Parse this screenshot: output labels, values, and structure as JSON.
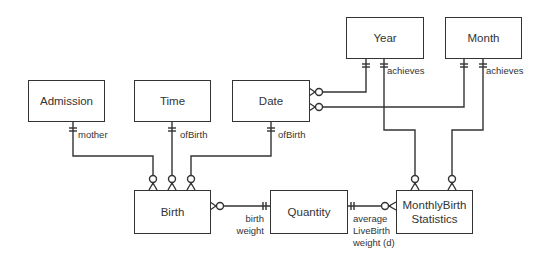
{
  "diagram": {
    "type": "entity-relationship",
    "entities": [
      {
        "id": "admission",
        "label": "Admission"
      },
      {
        "id": "time",
        "label": "Time"
      },
      {
        "id": "date",
        "label": "Date"
      },
      {
        "id": "year",
        "label": "Year"
      },
      {
        "id": "month",
        "label": "Month"
      },
      {
        "id": "birth",
        "label": "Birth"
      },
      {
        "id": "quantity",
        "label": "Quantity"
      },
      {
        "id": "monthly",
        "label": "MonthlyBirth Statistics",
        "line1": "MonthlyBirth",
        "line2": "Statistics"
      }
    ],
    "relationships": [
      {
        "from": "admission",
        "to": "birth",
        "label": "mother",
        "from_card": "one-and-only-one",
        "to_card": "zero-or-many"
      },
      {
        "from": "time",
        "to": "birth",
        "label": "ofBirth",
        "from_card": "one-and-only-one",
        "to_card": "zero-or-many"
      },
      {
        "from": "date",
        "to": "birth",
        "label": "ofBirth",
        "from_card": "one-and-only-one",
        "to_card": "zero-or-many"
      },
      {
        "from": "year",
        "to": "date",
        "label": "",
        "from_card": "one-and-only-one",
        "to_card": "zero-or-many"
      },
      {
        "from": "month",
        "to": "date",
        "label": "",
        "from_card": "one-and-only-one",
        "to_card": "zero-or-many"
      },
      {
        "from": "year",
        "to": "monthly",
        "label": "achieves",
        "from_card": "one-and-only-one",
        "to_card": "zero-or-many"
      },
      {
        "from": "month",
        "to": "monthly",
        "label": "achieves",
        "from_card": "one-and-only-one",
        "to_card": "zero-or-many"
      },
      {
        "from": "quantity",
        "to": "birth",
        "label": "birth weight",
        "line1": "birth",
        "line2": "weight",
        "from_card": "one-and-only-one",
        "to_card": "zero-or-many"
      },
      {
        "from": "quantity",
        "to": "monthly",
        "label": "average LiveBirth weight (d)",
        "line1": "average",
        "line2": "LiveBirth",
        "line3": "weight (d)",
        "from_card": "one-and-only-one",
        "to_card": "zero-or-many"
      }
    ],
    "colors": {
      "stroke": "#333333",
      "background": "#ffffff"
    }
  }
}
